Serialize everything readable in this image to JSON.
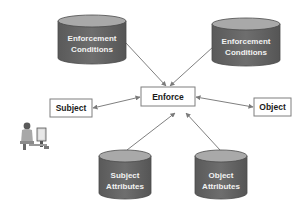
{
  "diagram": {
    "center": {
      "label": "Enforce"
    },
    "subject": {
      "label": "Subject"
    },
    "object": {
      "label": "Object"
    },
    "top_left_store": {
      "line1": "Enforcement",
      "line2": "Conditions"
    },
    "top_right_store": {
      "line1": "Enforcement",
      "line2": "Conditions"
    },
    "bottom_left_store": {
      "line1": "Subject",
      "line2": "Attributes"
    },
    "bottom_right_store": {
      "line1": "Object",
      "line2": "Attributes"
    },
    "user_icon": "person-at-computer-icon",
    "edges": [
      {
        "from": "Enforcement Conditions (left)",
        "to": "Enforce",
        "direction": "to"
      },
      {
        "from": "Enforcement Conditions (right)",
        "to": "Enforce",
        "direction": "to"
      },
      {
        "from": "Subject",
        "to": "Enforce",
        "direction": "both"
      },
      {
        "from": "Enforce",
        "to": "Object",
        "direction": "both"
      },
      {
        "from": "Subject Attributes",
        "to": "Enforce",
        "direction": "to"
      },
      {
        "from": "Object Attributes",
        "to": "Enforce",
        "direction": "to"
      }
    ],
    "colors": {
      "cylinder_body": "#6b6b6b",
      "cylinder_top": "#a9a9a9",
      "cylinder_edge": "#4a4a4a",
      "box_border": "#7f7f7f",
      "arrow": "#808080",
      "text_dark": "#1a1a1a",
      "text_light": "#f2f2f2"
    }
  }
}
